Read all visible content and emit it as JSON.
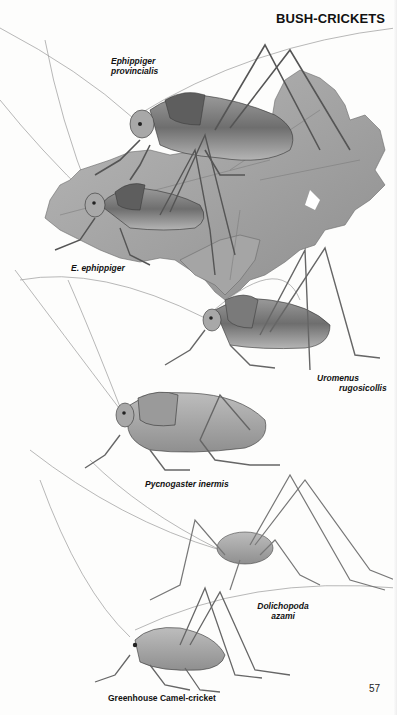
{
  "page": {
    "section_title": "BUSH-CRICKETS",
    "page_number": "57"
  },
  "illustrations": [
    {
      "id": "ephippiger-provincialis",
      "label_lines": [
        "Ephippiger",
        "provincialis"
      ],
      "style": "italic"
    },
    {
      "id": "e-ephippiger",
      "label_lines": [
        "E. ephippiger"
      ],
      "style": "italic"
    },
    {
      "id": "uromenus-rugosicollis",
      "label_lines": [
        "Uromenus",
        "rugosicollis"
      ],
      "style": "italic"
    },
    {
      "id": "pycnogaster-inermis",
      "label_lines": [
        "Pycnogaster inermis"
      ],
      "style": "italic"
    },
    {
      "id": "dolichopoda-azami",
      "label_lines": [
        "Dolichopoda",
        "azami"
      ],
      "style": "italic"
    },
    {
      "id": "greenhouse-camel-cricket",
      "label_lines": [
        "Greenhouse Camel-cricket"
      ],
      "style": "normal"
    }
  ],
  "colors": {
    "ink": "#111111",
    "leaf": "#9a9a9a",
    "body": "#8a8a8a",
    "paper": "#fdfdfc"
  }
}
